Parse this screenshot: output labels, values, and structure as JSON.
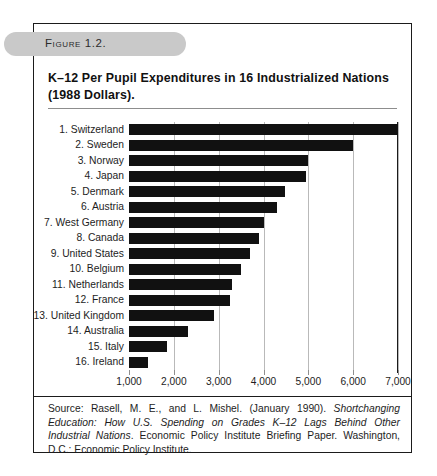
{
  "figure": {
    "pill_label": "Figure 1.2.",
    "title_line1": "K–12 Per Pupil Expenditures in 16 Industrialized Nations",
    "title_line2": "(1988 Dollars)."
  },
  "source": {
    "prefix": "Source: Rasell, M. E., and L. Mishel. (January 1990). ",
    "italic": "Shortchanging Education: How U.S. Spending on Grades K–12 Lags Behind Other Industrial Nations",
    "suffix": ". Economic Policy Institute Briefing Paper. Washington, D.C.: Economic Policy Institute."
  },
  "chart_data": {
    "type": "bar",
    "orientation": "horizontal",
    "title": "K–12 Per Pupil Expenditures in 16 Industrialized Nations (1988 Dollars).",
    "xlabel": "",
    "ylabel": "",
    "xlim": [
      1000,
      7000
    ],
    "xticks": [
      1000,
      2000,
      3000,
      4000,
      5000,
      6000,
      7000
    ],
    "xticklabels": [
      "1,000",
      "2,000",
      "3,000",
      "4,000",
      "5,000",
      "6,000",
      "7,000"
    ],
    "grid": true,
    "legend": false,
    "bar_color": "#111111",
    "categories": [
      "1. Switzerland",
      "2. Sweden",
      "3. Norway",
      "4. Japan",
      "5. Denmark",
      "6. Austria",
      "7. West Germany",
      "8. Canada",
      "9. United States",
      "10. Belgium",
      "11. Netherlands",
      "12. France",
      "13. United Kingdom",
      "14. Australia",
      "15. Italy",
      "16. Ireland"
    ],
    "values": [
      7000,
      6000,
      5000,
      4950,
      4470,
      4300,
      4000,
      3900,
      3700,
      3500,
      3300,
      3250,
      2900,
      2320,
      1850,
      1420
    ]
  }
}
